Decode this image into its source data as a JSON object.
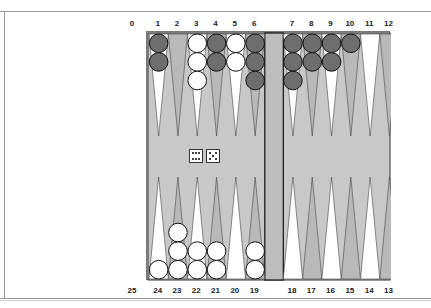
{
  "game": "backgammon",
  "labels": {
    "top_left_home": "0",
    "bottom_left_home": "25",
    "top_points": [
      "1",
      "2",
      "3",
      "4",
      "5",
      "6",
      "7",
      "8",
      "9",
      "10",
      "11",
      "12"
    ],
    "bottom_points": [
      "24",
      "23",
      "22",
      "21",
      "20",
      "19",
      "18",
      "17",
      "16",
      "15",
      "14",
      "13"
    ]
  },
  "colors": {
    "board_bg": "#c8c8c8",
    "bar": "#bdbdbd",
    "point_light": "#ffffff",
    "point_dark": "#b9b9b9",
    "checker_dark": "#6e6e6e",
    "checker_light": "#ffffff",
    "outline": "#333333"
  },
  "dice": [
    6,
    5
  ],
  "checkers": {
    "top": [
      {
        "point": "1",
        "color": "dark",
        "count": 2
      },
      {
        "point": "3",
        "color": "light",
        "count": 3
      },
      {
        "point": "4",
        "color": "dark",
        "count": 2
      },
      {
        "point": "5",
        "color": "light",
        "count": 2
      },
      {
        "point": "6",
        "color": "dark",
        "count": 3
      },
      {
        "point": "7",
        "color": "dark",
        "count": 3
      },
      {
        "point": "8",
        "color": "dark",
        "count": 2
      },
      {
        "point": "9",
        "color": "dark",
        "count": 2
      },
      {
        "point": "10",
        "color": "dark",
        "count": 1
      }
    ],
    "bottom": [
      {
        "point": "24",
        "color": "light",
        "count": 1
      },
      {
        "point": "23",
        "color": "light",
        "count": 3
      },
      {
        "point": "22",
        "color": "light",
        "count": 2
      },
      {
        "point": "21",
        "color": "light",
        "count": 2
      },
      {
        "point": "19",
        "color": "light",
        "count": 2
      }
    ]
  }
}
